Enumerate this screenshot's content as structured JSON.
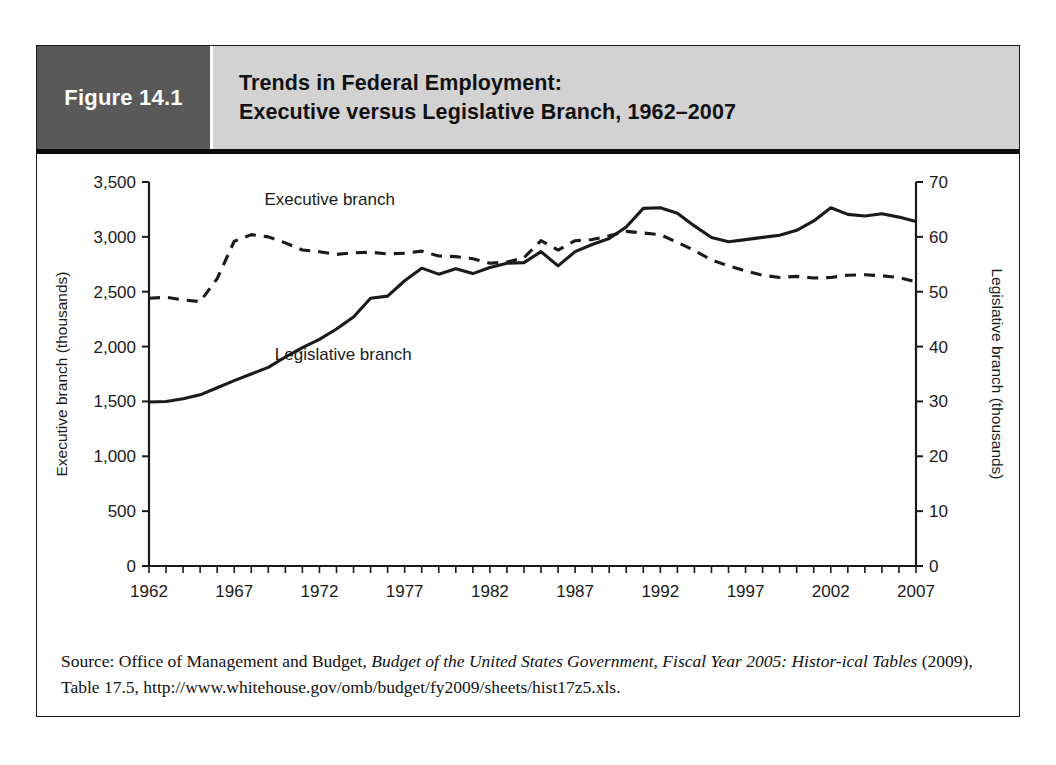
{
  "figure": {
    "tag_label": "Figure 14.1",
    "title_line1": "Trends in Federal Employment:",
    "title_line2": "Executive versus Legislative Branch, 1962–2007",
    "colors": {
      "tag_background": "#595959",
      "title_background": "#d2d2d2",
      "rule": "#0c0c0c",
      "frame": "#1a1a1a",
      "line": "#1a1a1a"
    }
  },
  "source": {
    "prefix": "Source: Office of Management and Budget, ",
    "italic1": "Budget of the United States Government, Fiscal Year 2005: Histor-",
    "italic2": "ical Tables",
    "suffix": " (2009), Table 17.5, http://www.whitehouse.gov/omb/budget/fy2009/sheets/hist17z5.xls."
  },
  "chart_data": {
    "type": "line",
    "title": "Trends in Federal Employment: Executive versus Legislative Branch, 1962–2007",
    "xlabel": "",
    "ylabel": "Executive branch (thousands)",
    "y2label": "Legislative branch (thousands)",
    "xlim": [
      1962,
      2007
    ],
    "ylim": [
      0,
      3500
    ],
    "y2lim": [
      0,
      70
    ],
    "yticks": [
      "0",
      "500",
      "1,000",
      "1,500",
      "2,000",
      "2,500",
      "3,000",
      "3,500"
    ],
    "ytick_values": [
      0,
      500,
      1000,
      1500,
      2000,
      2500,
      3000,
      3500
    ],
    "y2ticks": [
      "0",
      "10",
      "20",
      "30",
      "40",
      "50",
      "60",
      "70"
    ],
    "y2tick_values": [
      0,
      10,
      20,
      30,
      40,
      50,
      60,
      70
    ],
    "xticks": [
      "1962",
      "1967",
      "1972",
      "1977",
      "1982",
      "1987",
      "1992",
      "1997",
      "2002",
      "2007"
    ],
    "xtick_values": [
      1962,
      1967,
      1972,
      1977,
      1982,
      1987,
      1992,
      1997,
      2002,
      2007
    ],
    "minor_xtick_interval": 1,
    "grid": false,
    "legend_position": "inline-annotations",
    "annotations": [
      {
        "text": "Executive branch",
        "x": 1972.6,
        "y_axis": "left",
        "y": 3290
      },
      {
        "text": "Legislative branch",
        "x": 1973.4,
        "y_axis": "left",
        "y": 1880
      }
    ],
    "x": [
      1962,
      1963,
      1964,
      1965,
      1966,
      1967,
      1968,
      1969,
      1970,
      1971,
      1972,
      1973,
      1974,
      1975,
      1976,
      1977,
      1978,
      1979,
      1980,
      1981,
      1982,
      1983,
      1984,
      1985,
      1986,
      1987,
      1988,
      1989,
      1990,
      1991,
      1992,
      1993,
      1994,
      1995,
      1996,
      1997,
      1998,
      1999,
      2000,
      2001,
      2002,
      2003,
      2004,
      2005,
      2006,
      2007
    ],
    "series": [
      {
        "name": "Executive branch",
        "axis": "left",
        "units": "thousands",
        "style": "dashed",
        "values": [
          2440,
          2450,
          2425,
          2410,
          2620,
          2960,
          3020,
          3000,
          2945,
          2880,
          2865,
          2840,
          2855,
          2860,
          2845,
          2850,
          2870,
          2825,
          2820,
          2800,
          2760,
          2770,
          2810,
          2965,
          2880,
          2965,
          2975,
          3010,
          3050,
          3035,
          3020,
          2950,
          2875,
          2790,
          2735,
          2690,
          2650,
          2630,
          2640,
          2625,
          2630,
          2650,
          2655,
          2645,
          2630,
          2590
        ]
      },
      {
        "name": "Legislative branch",
        "axis": "right",
        "units": "thousands",
        "style": "solid",
        "values": [
          29.9,
          30.0,
          30.5,
          31.2,
          32.5,
          33.8,
          35.0,
          36.2,
          38.1,
          39.8,
          41.3,
          43.2,
          45.4,
          48.8,
          49.2,
          52.0,
          54.3,
          53.2,
          54.2,
          53.3,
          54.4,
          55.2,
          55.3,
          57.3,
          54.7,
          57.3,
          58.6,
          59.7,
          61.8,
          65.2,
          65.3,
          64.3,
          62.0,
          59.9,
          59.1,
          59.5,
          59.9,
          60.3,
          61.2,
          62.9,
          65.3,
          64.1,
          63.8,
          64.2,
          63.6,
          62.8
        ]
      }
    ]
  }
}
